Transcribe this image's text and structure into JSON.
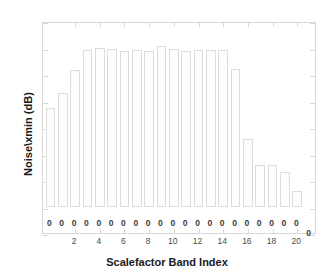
{
  "chart_data": {
    "type": "bar",
    "title": "",
    "subtitle": "",
    "xlabel": "Scalefactor Band Index",
    "ylabel": "Noise\\xmin (dB)",
    "xlim": [
      -0.6,
      21.6
    ],
    "ylim": [
      -20,
      140
    ],
    "ytick_labels": [
      "-20",
      "0",
      "20",
      "40",
      "60",
      "80",
      "100",
      "120",
      "140"
    ],
    "ytick_values": [
      -20,
      0,
      20,
      40,
      60,
      80,
      100,
      120,
      140
    ],
    "xtick_labels": [
      "2",
      "4",
      "6",
      "8",
      "10",
      "12",
      "14",
      "16",
      "18",
      "20"
    ],
    "xtick_values": [
      2,
      4,
      6,
      8,
      10,
      12,
      14,
      16,
      18,
      20
    ],
    "grid": false,
    "legend": null,
    "bar_color": "#fdfdfd",
    "bar_edge_color": "#dcdcdc",
    "axis_color": "#d8d8d8",
    "categories": [
      0,
      1,
      2,
      3,
      4,
      5,
      6,
      7,
      8,
      9,
      10,
      11,
      12,
      13,
      14,
      15,
      16,
      17,
      18,
      19,
      20,
      21
    ],
    "values": [
      74,
      86,
      103,
      118,
      120,
      119,
      117,
      118,
      117,
      121,
      119,
      117,
      118,
      118,
      118,
      104,
      51,
      31,
      31,
      26,
      12,
      0
    ],
    "data_labels": [
      "0",
      "0",
      "0",
      "0",
      "0",
      "0",
      "0",
      "0",
      "0",
      "0",
      "0",
      "0",
      "0",
      "0",
      "0",
      "0",
      "0",
      "0",
      "0",
      "0",
      "0",
      "0"
    ]
  }
}
